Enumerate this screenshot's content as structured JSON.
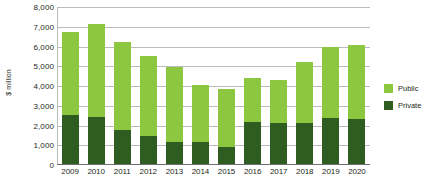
{
  "chart_data": {
    "type": "bar",
    "subtype": "stacked-vertical",
    "title": "",
    "subtitle": "",
    "xlabel": "",
    "ylabel": "$ million",
    "ylim": [
      0,
      8000
    ],
    "ytick_step": 1000,
    "ytick_labels": [
      "8,000",
      "7,000",
      "6,000",
      "5,000",
      "4,000",
      "3,000",
      "2,000",
      "1,000",
      "0"
    ],
    "ytick_values": [
      8000,
      7000,
      6000,
      5000,
      4000,
      3000,
      2000,
      1000,
      0
    ],
    "grid": "horizontal",
    "legend_position": "right",
    "categories": [
      "2009",
      "2010",
      "2011",
      "2012",
      "2013",
      "2014",
      "2015",
      "2016",
      "2017",
      "2018",
      "2019",
      "2020"
    ],
    "series": [
      {
        "name": "Public",
        "color": "#8DC63F",
        "values": [
          4200,
          4700,
          4500,
          4050,
          3800,
          2900,
          2950,
          2200,
          2150,
          3050,
          3600,
          3750
        ]
      },
      {
        "name": "Private",
        "color": "#2F5D21",
        "values": [
          2550,
          2450,
          1750,
          1450,
          1150,
          1150,
          900,
          2200,
          2150,
          2150,
          2400,
          2350
        ]
      }
    ],
    "totals": [
      6750,
      7150,
      6250,
      5500,
      4950,
      4050,
      3850,
      4400,
      4300,
      5200,
      6000,
      6100
    ]
  },
  "legend": {
    "items": [
      {
        "label": "Public",
        "color": "#8DC63F"
      },
      {
        "label": "Private",
        "color": "#2F5D21"
      }
    ]
  },
  "colors": {
    "public": "#8DC63F",
    "private": "#2F5D21",
    "gridline": "#b9bbbd",
    "axis": "#6d6e71",
    "text": "#231f20",
    "background": "#ffffff"
  }
}
